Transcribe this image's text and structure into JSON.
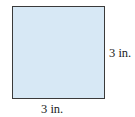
{
  "figure": {
    "shape": "square",
    "fill_color": "#d7e8f5",
    "border_color": "#3a3a3a",
    "side_label_right": "3 in.",
    "side_label_bottom": "3 in."
  }
}
